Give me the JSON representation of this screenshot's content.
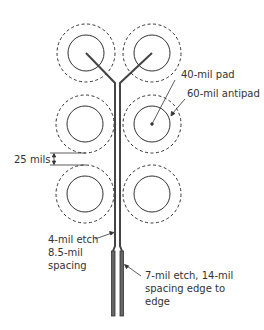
{
  "diagram": {
    "type": "pcb-via-breakout",
    "colors": {
      "line": "#333333",
      "trace": "#555555",
      "background": "#ffffff"
    },
    "pads": [
      {
        "id": "r1c1",
        "cx": 86,
        "cy": 53
      },
      {
        "id": "r1c2",
        "cx": 152,
        "cy": 53
      },
      {
        "id": "r2c1",
        "cx": 85,
        "cy": 124
      },
      {
        "id": "r2c2",
        "cx": 152,
        "cy": 124
      },
      {
        "id": "r3c1",
        "cx": 85,
        "cy": 194
      },
      {
        "id": "r3c2",
        "cx": 152,
        "cy": 194
      }
    ],
    "pad_radius": 18,
    "antipad_radius": 29,
    "labels": {
      "pad": "40-mil pad",
      "antipad": "60-mil antipad",
      "gap": "25 mils",
      "narrow_etch_line1": "4-mil etch",
      "narrow_etch_line2": "8.5-mil",
      "narrow_etch_line3": "spacing",
      "wide_etch_line1": "7-mil etch, 14-mil",
      "wide_etch_line2": "spacing edge to",
      "wide_etch_line3": "edge"
    }
  }
}
